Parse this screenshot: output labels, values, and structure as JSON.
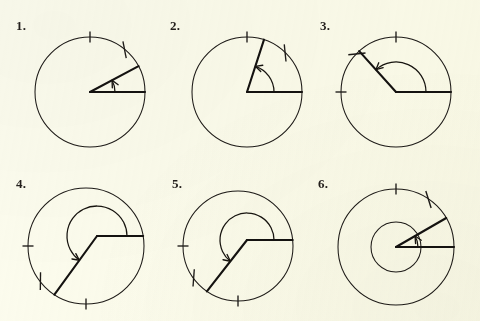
{
  "page": {
    "background_color": "#fcfcee",
    "ink_color": "#1d1a17",
    "width": 480,
    "height": 321
  },
  "figures": [
    {
      "number": "1.",
      "label_x": 16,
      "label_y": 18,
      "center_x": 90,
      "center_y": 92,
      "radius": 55,
      "inner_radius": 0,
      "vertex_x": 90,
      "vertex_y": 92,
      "angle_deg": 28,
      "base_angle_deg": 0,
      "reflex": false,
      "arc_radius": 25,
      "arrow_at": "terminal",
      "ticks": [
        90,
        50
      ],
      "tick_styles": [
        "radial",
        "slanted"
      ],
      "description": "acute angle about 28 degrees, vertex at centre, initial ray to the right"
    },
    {
      "number": "2.",
      "label_x": 170,
      "label_y": 18,
      "center_x": 247,
      "center_y": 92,
      "radius": 55,
      "inner_radius": 0,
      "vertex_x": 247,
      "vertex_y": 92,
      "angle_deg": 72,
      "base_angle_deg": 0,
      "reflex": false,
      "arc_radius": 27,
      "arrow_at": "terminal",
      "ticks": [
        90,
        45
      ],
      "tick_styles": [
        "radial",
        "slanted"
      ],
      "description": "acute angle about 72 degrees, vertex at centre, initial ray to the right"
    },
    {
      "number": "3.",
      "label_x": 320,
      "label_y": 18,
      "center_x": 396,
      "center_y": 92,
      "radius": 55,
      "inner_radius": 0,
      "vertex_x": 396,
      "vertex_y": 92,
      "angle_deg": 132,
      "base_angle_deg": 0,
      "reflex": false,
      "arc_radius": 30,
      "arrow_at": "terminal",
      "ticks": [
        90,
        135,
        180
      ],
      "tick_styles": [
        "radial",
        "slanted",
        "radial"
      ],
      "description": "obtuse angle about 132 degrees, vertex at centre, initial ray to the right"
    },
    {
      "number": "4.",
      "label_x": 16,
      "label_y": 176,
      "center_x": 86,
      "center_y": 246,
      "radius": 58,
      "inner_radius": 0,
      "vertex_x": 97,
      "vertex_y": 236,
      "angle_deg": 234,
      "base_angle_deg": 0,
      "reflex": true,
      "arc_radius": 30,
      "arrow_at": "terminal",
      "ticks": [
        180,
        217,
        270
      ],
      "tick_styles": [
        "radial",
        "slanted",
        "radial"
      ],
      "description": "reflex angle about 234 degrees, vertex offset above-right of centre"
    },
    {
      "number": "5.",
      "label_x": 172,
      "label_y": 176,
      "center_x": 238,
      "center_y": 246,
      "radius": 55,
      "inner_radius": 0,
      "vertex_x": 247,
      "vertex_y": 240,
      "angle_deg": 232,
      "base_angle_deg": 0,
      "reflex": true,
      "arc_radius": 27,
      "arrow_at": "terminal",
      "ticks": [
        180,
        215,
        270
      ],
      "tick_styles": [
        "radial",
        "slanted",
        "radial"
      ],
      "description": "reflex angle about 232 degrees, vertex near centre"
    },
    {
      "number": "6.",
      "label_x": 318,
      "label_y": 176,
      "center_x": 396,
      "center_y": 247,
      "radius": 58,
      "inner_radius": 25,
      "vertex_x": 396,
      "vertex_y": 247,
      "angle_deg": 30,
      "base_angle_deg": 0,
      "reflex": false,
      "arc_radius": 22,
      "arrow_at": "terminal",
      "ticks": [
        90,
        55
      ],
      "tick_styles": [
        "radial",
        "slanted"
      ],
      "description": "acute angle about 30 degrees with an inner concentric circle"
    }
  ]
}
